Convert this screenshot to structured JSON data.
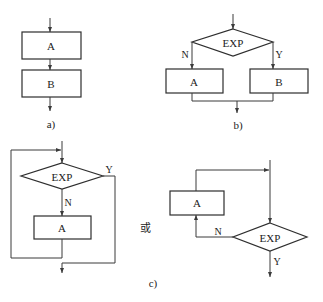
{
  "diagram": {
    "a": {
      "caption": "a)",
      "boxes": [
        "A",
        "B"
      ]
    },
    "b": {
      "caption": "b)",
      "condition": "EXP",
      "no_label": "N",
      "yes_label": "Y",
      "boxes": [
        "A",
        "B"
      ]
    },
    "c": {
      "caption": "c)",
      "or_text": "或",
      "left": {
        "condition": "EXP",
        "no_label": "N",
        "yes_label": "Y",
        "box": "A"
      },
      "right": {
        "condition": "EXP",
        "no_label": "N",
        "yes_label": "Y",
        "box": "A"
      }
    }
  }
}
